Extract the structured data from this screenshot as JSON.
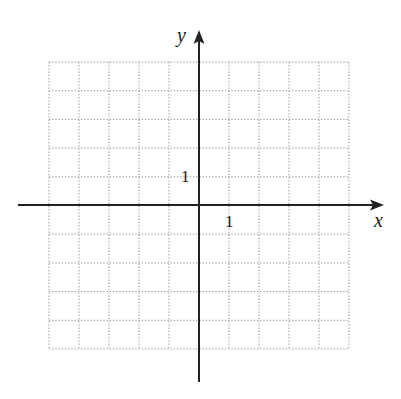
{
  "chart_data": {
    "type": "line",
    "title": "",
    "subtitle": "",
    "xlabel": "x",
    "ylabel": "y",
    "xlim": [
      -5,
      5
    ],
    "ylim": [
      -5,
      5
    ],
    "grid": true,
    "grid_style": "dotted",
    "x_ticks_labeled": [
      {
        "value": 1,
        "label": "1"
      }
    ],
    "y_ticks_labeled": [
      {
        "value": 1,
        "label": "1"
      }
    ],
    "series": [],
    "legend": null,
    "annotations": []
  },
  "axes": {
    "x_label": "x",
    "y_label": "y",
    "x_unit_label": "1",
    "y_unit_label": "1"
  },
  "colors": {
    "axis": "#222222",
    "grid": "#888888",
    "background": "#ffffff"
  }
}
